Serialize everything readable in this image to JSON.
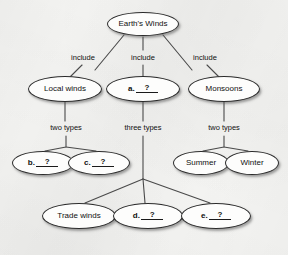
{
  "diagram": {
    "background_color": "#f4f4f2",
    "node_fill_color": "#fdfdfc",
    "node_stroke_color": "#2b2b2b",
    "edge_color": "#4a4a4a",
    "text_color": "#101010"
  },
  "nodes": [
    {
      "id": "root",
      "label": "Earth's Winds",
      "prefix": "",
      "blank": false,
      "cx": 143,
      "cy": 24,
      "w": 72,
      "h": 24
    },
    {
      "id": "local",
      "label": "Local winds",
      "prefix": "",
      "blank": false,
      "cx": 65,
      "cy": 89,
      "w": 74,
      "h": 26
    },
    {
      "id": "a",
      "label": "?",
      "prefix": "a.",
      "blank": true,
      "cx": 143,
      "cy": 89,
      "w": 74,
      "h": 26
    },
    {
      "id": "monsoons",
      "label": "Monsoons",
      "prefix": "",
      "blank": false,
      "cx": 224,
      "cy": 89,
      "w": 72,
      "h": 26
    },
    {
      "id": "b",
      "label": "?",
      "prefix": "b.",
      "blank": true,
      "cx": 43,
      "cy": 163,
      "w": 62,
      "h": 24
    },
    {
      "id": "c",
      "label": "?",
      "prefix": "c.",
      "blank": true,
      "cx": 99,
      "cy": 163,
      "w": 62,
      "h": 24
    },
    {
      "id": "summer",
      "label": "Summer",
      "prefix": "",
      "blank": false,
      "cx": 201,
      "cy": 163,
      "w": 56,
      "h": 24
    },
    {
      "id": "winter",
      "label": "Winter",
      "prefix": "",
      "blank": false,
      "cx": 252,
      "cy": 163,
      "w": 54,
      "h": 24
    },
    {
      "id": "trade",
      "label": "Trade winds",
      "prefix": "",
      "blank": false,
      "cx": 79,
      "cy": 216,
      "w": 74,
      "h": 26
    },
    {
      "id": "d",
      "label": "?",
      "prefix": "d.",
      "blank": true,
      "cx": 148,
      "cy": 216,
      "w": 70,
      "h": 26
    },
    {
      "id": "e",
      "label": "?",
      "prefix": "e.",
      "blank": true,
      "cx": 216,
      "cy": 216,
      "w": 70,
      "h": 26
    }
  ],
  "edge_labels": [
    {
      "id": "include-left",
      "text": "include",
      "x": 83,
      "y": 58
    },
    {
      "id": "include-center",
      "text": "include",
      "x": 143,
      "y": 58
    },
    {
      "id": "include-right",
      "text": "include",
      "x": 205,
      "y": 58
    },
    {
      "id": "two-types-left",
      "text": "two types",
      "x": 66,
      "y": 128
    },
    {
      "id": "three-types",
      "text": "three types",
      "x": 143,
      "y": 128
    },
    {
      "id": "two-types-right",
      "text": "two types",
      "x": 224,
      "y": 128
    }
  ],
  "edges": [
    {
      "id": "root-to-local",
      "from": "root",
      "to": "local",
      "path": "M 124 35 L 95 70"
    },
    {
      "id": "root-to-a",
      "from": "root",
      "to": "a",
      "path": "M 143 37 L 143 50"
    },
    {
      "id": "root-to-a-lower",
      "from": "root",
      "to": "a",
      "path": "M 143 65 L 143 77"
    },
    {
      "id": "root-to-monsoons",
      "from": "root",
      "to": "monsoons",
      "path": "M 163 35 L 192 70"
    },
    {
      "id": "local-stub",
      "from": "root",
      "to": "local",
      "path": "M 82 65 L 70 77"
    },
    {
      "id": "monsoons-stub",
      "from": "root",
      "to": "monsoons",
      "path": "M 207 65 L 219 77"
    },
    {
      "id": "local-down",
      "from": "local",
      "to": "junction-left",
      "path": "M 65 102 L 65 121"
    },
    {
      "id": "a-down",
      "from": "a",
      "to": "junction-center",
      "path": "M 143 102 L 143 121"
    },
    {
      "id": "monsoons-down",
      "from": "monsoons",
      "to": "junction-right",
      "path": "M 224 102 L 224 121"
    },
    {
      "id": "left-split-b",
      "from": "junction-left",
      "to": "b",
      "path": "M 66 136 L 66 147 L 45 151"
    },
    {
      "id": "left-split-c",
      "from": "junction-left",
      "to": "c",
      "path": "M 66 147 L 96 151"
    },
    {
      "id": "center-trunk",
      "from": "junction-center",
      "to": "fan",
      "path": "M 143 136 L 143 179"
    },
    {
      "id": "fan-trade",
      "from": "fan",
      "to": "trade",
      "path": "M 143 179 L 85 203"
    },
    {
      "id": "fan-d",
      "from": "fan",
      "to": "d",
      "path": "M 143 179 L 145 203"
    },
    {
      "id": "fan-e",
      "from": "fan",
      "to": "e",
      "path": "M 143 179 L 210 203"
    },
    {
      "id": "right-split-summer",
      "from": "junction-right",
      "to": "summer",
      "path": "M 224 136 L 224 147 L 203 151"
    },
    {
      "id": "right-split-winter",
      "from": "junction-right",
      "to": "winter",
      "path": "M 224 147 L 248 151"
    }
  ]
}
